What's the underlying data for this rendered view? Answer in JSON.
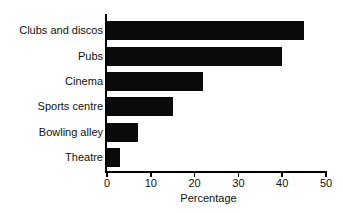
{
  "chart_data": {
    "type": "bar",
    "orientation": "horizontal",
    "title": "",
    "xlabel": "Percentage",
    "ylabel": "",
    "categories": [
      "Clubs and discos",
      "Pubs",
      "Cinema",
      "Sports centre",
      "Bowling alley",
      "Theatre"
    ],
    "values": [
      45,
      40,
      22,
      15,
      7,
      3
    ],
    "xlim": [
      0,
      50
    ],
    "xticks": [
      0,
      10,
      20,
      30,
      40,
      50
    ],
    "xtick_labels": [
      "0",
      "10",
      "20",
      "30",
      "40",
      "50"
    ],
    "grid": false,
    "legend": null,
    "bar_color": "#0a0a0a",
    "background_color": "#ffffff",
    "axis_color": "#000000"
  }
}
